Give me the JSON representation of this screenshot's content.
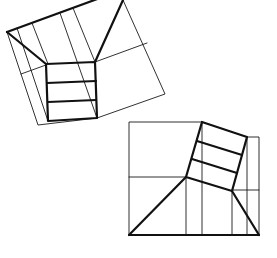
{
  "figures": [
    {
      "name": "rotated-staircase-plan",
      "description": "Rotated square floor plan with central stair flight and splayed walls",
      "stair_treads": 3
    },
    {
      "name": "upright-staircase-plan",
      "description": "Square floor plan with tilted stair flight and splayed walls",
      "stair_treads": 3
    }
  ],
  "colors": {
    "line": "#111111",
    "background": "#ffffff"
  }
}
